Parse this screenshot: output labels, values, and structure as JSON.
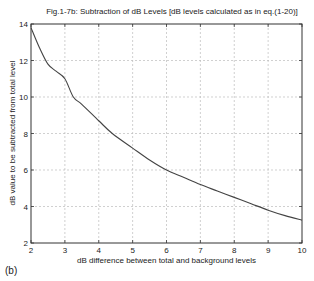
{
  "panel_label": "(b)",
  "chart_data": {
    "type": "line",
    "title": "Fig.1-7b: Subtraction of dB Levels [dB levels calculated as in eq.(1-20)]",
    "xlabel": "dB difference between total and background levels",
    "ylabel": "dB value to be subtracted from total level",
    "xlim": [
      2,
      10
    ],
    "ylim": [
      2,
      14
    ],
    "x_ticks": [
      2,
      3,
      4,
      5,
      6,
      7,
      8,
      9,
      10
    ],
    "y_ticks": [
      2,
      4,
      6,
      8,
      10,
      12,
      14
    ],
    "grid": true,
    "legend": null,
    "series": [
      {
        "name": "subtraction curve",
        "color": "#444444",
        "x": [
          2.0,
          2.25,
          2.5,
          2.75,
          3.0,
          3.25,
          3.5,
          4.0,
          4.4,
          5.0,
          5.5,
          6.0,
          6.5,
          7.0,
          7.5,
          8.0,
          8.5,
          9.0,
          9.5,
          10.0
        ],
        "y": [
          13.8,
          12.7,
          11.8,
          11.4,
          11.0,
          10.0,
          9.6,
          8.7,
          8.0,
          7.2,
          6.55,
          6.0,
          5.6,
          5.2,
          4.85,
          4.5,
          4.15,
          3.8,
          3.5,
          3.25
        ]
      }
    ]
  }
}
